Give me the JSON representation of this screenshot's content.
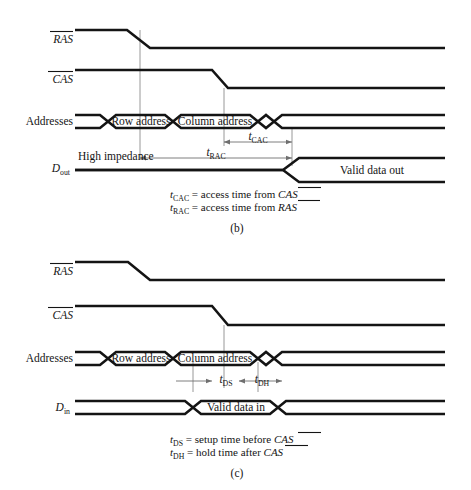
{
  "figure": {
    "kind": "dram-timing-diagram",
    "panels": [
      {
        "id": "b",
        "panel_label": "(b)",
        "signals": [
          {
            "name": "RAS",
            "label": "RAS",
            "overbar": true,
            "italic": true
          },
          {
            "name": "CAS",
            "label": "CAS",
            "overbar": true,
            "italic": true
          },
          {
            "name": "Addresses",
            "label": "Addresses",
            "overbar": false,
            "italic": false
          },
          {
            "name": "Dout",
            "label": "D",
            "subscript": "out",
            "overbar": false,
            "italic": true
          }
        ],
        "bus_values": [
          "Row address",
          "Column address"
        ],
        "data_label": "Valid data out",
        "state_label": "High impedance",
        "intervals": [
          {
            "name": "tCAC",
            "base": "t",
            "sub": "CAC"
          },
          {
            "name": "tRAC",
            "base": "t",
            "sub": "RAC"
          }
        ],
        "caption": [
          {
            "base": "t",
            "sub": "CAC",
            "eq": "=",
            "text": "access time from",
            "signal": "CAS",
            "overbar": true
          },
          {
            "base": "t",
            "sub": "RAC",
            "eq": "=",
            "text": "access time from",
            "signal": "RAS",
            "overbar": true
          }
        ]
      },
      {
        "id": "c",
        "panel_label": "(c)",
        "signals": [
          {
            "name": "RAS",
            "label": "RAS",
            "overbar": true,
            "italic": true
          },
          {
            "name": "CAS",
            "label": "CAS",
            "overbar": true,
            "italic": true
          },
          {
            "name": "Addresses",
            "label": "Addresses",
            "overbar": false,
            "italic": false
          },
          {
            "name": "Din",
            "label": "D",
            "subscript": "in",
            "overbar": false,
            "italic": true
          }
        ],
        "bus_values": [
          "Row address",
          "Column address"
        ],
        "data_label": "Valid data in",
        "intervals": [
          {
            "name": "tDS",
            "base": "t",
            "sub": "DS"
          },
          {
            "name": "tDH",
            "base": "t",
            "sub": "DH"
          }
        ],
        "caption": [
          {
            "base": "t",
            "sub": "DS",
            "eq": "=",
            "text": "setup time before",
            "signal": "CAS",
            "overbar": true
          },
          {
            "base": "t",
            "sub": "DH",
            "eq": "=",
            "text": "hold time after",
            "signal": "CAS",
            "overbar": true
          }
        ]
      }
    ],
    "colors": {
      "waveform": "#141414",
      "dropline": "#8d8d8d",
      "measure": "#6f6f6f",
      "background": "#ffffff"
    }
  }
}
